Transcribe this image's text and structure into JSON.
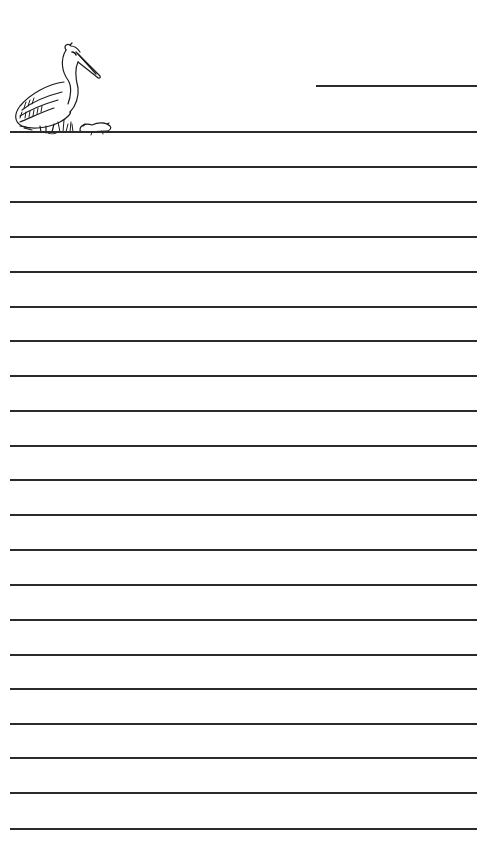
{
  "paper": {
    "type": "lined writing paper",
    "background": "#ffffff",
    "line_color": "#2b2b2b",
    "header_line": {
      "label": "name-line",
      "top": 85,
      "left": 316,
      "width": 161
    },
    "rule_lines": [
      131,
      166,
      201,
      236,
      271,
      306,
      340,
      375,
      410,
      445,
      479,
      514,
      549,
      584,
      619,
      654,
      688,
      723,
      757,
      792,
      828
    ],
    "illustration": {
      "name": "pelican-with-mouse-icon",
      "description": "Pelican standing on grass beside a small rodent"
    }
  }
}
